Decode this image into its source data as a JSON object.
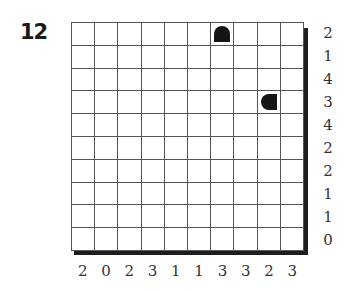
{
  "puzzle": {
    "number": "12",
    "rows": 10,
    "cols": 10,
    "row_clues": [
      "2",
      "1",
      "4",
      "3",
      "4",
      "2",
      "2",
      "1",
      "1",
      "0"
    ],
    "col_clues": [
      "2",
      "0",
      "2",
      "3",
      "1",
      "1",
      "3",
      "3",
      "2",
      "3"
    ],
    "given_pieces": [
      {
        "row": 0,
        "col": 6,
        "type": "end-top"
      },
      {
        "row": 3,
        "col": 8,
        "type": "end-left"
      }
    ],
    "colors": {
      "piece": "#151515",
      "grid_line": "#555555",
      "shadow": "#1e1e1e"
    }
  }
}
